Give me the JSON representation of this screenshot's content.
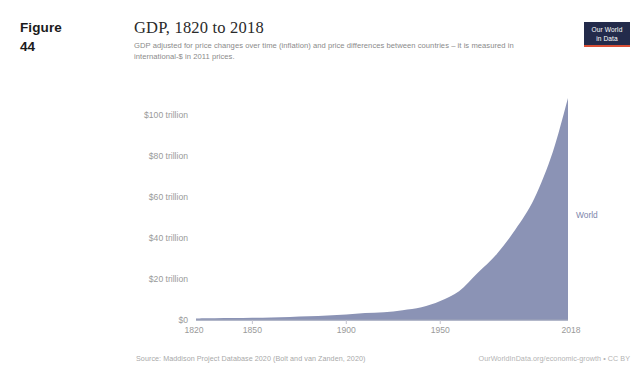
{
  "figure": {
    "word": "Figure",
    "number": "44"
  },
  "chart": {
    "title": "GDP, 1820 to 2018",
    "subtitle": "GDP adjusted for price changes over time (inflation) and price differences between countries – it is measured in international-$ in 2011 prices.",
    "logo": {
      "line1": "Our World",
      "line2": "in Data",
      "background": "#232b4b",
      "accent": "#d94f36"
    },
    "footer": {
      "source": "Source: Maddison Project Database 2020 (Bolt and van Zanden, 2020)",
      "credit": "OurWorldInData.org/economic-growth • CC BY"
    }
  },
  "chart_data": {
    "type": "area",
    "title": "GDP, 1820 to 2018",
    "subtitle": "GDP adjusted for price changes over time (inflation) and price differences between countries – it is measured in international-$ in 2011 prices.",
    "xlabel": "",
    "ylabel": "",
    "xlim": [
      1820,
      2018
    ],
    "ylim": [
      0,
      110
    ],
    "y_unit": "trillion international-$ (2011 prices)",
    "grid": false,
    "legend_position": "right-inline",
    "series_color": "#8b93b5",
    "series": [
      {
        "name": "World",
        "label": "World",
        "x": [
          1820,
          1830,
          1840,
          1850,
          1860,
          1870,
          1880,
          1890,
          1900,
          1910,
          1920,
          1930,
          1940,
          1950,
          1960,
          1970,
          1980,
          1990,
          2000,
          2010,
          2018
        ],
        "values": [
          0.74,
          0.82,
          0.92,
          1.05,
          1.25,
          1.5,
          1.85,
          2.2,
          2.7,
          3.4,
          3.8,
          4.8,
          6.2,
          9.3,
          14.0,
          23.0,
          32.0,
          44.0,
          59.0,
          82.0,
          108.0
        ]
      }
    ],
    "x_ticks": [
      {
        "value": 1820,
        "label": "1820"
      },
      {
        "value": 1850,
        "label": "1850"
      },
      {
        "value": 1900,
        "label": "1900"
      },
      {
        "value": 1950,
        "label": "1950"
      },
      {
        "value": 2018,
        "label": "2018"
      }
    ],
    "y_ticks": [
      {
        "value": 0,
        "label": "$0"
      },
      {
        "value": 20,
        "label": "$20 trillion"
      },
      {
        "value": 40,
        "label": "$40 trillion"
      },
      {
        "value": 60,
        "label": "$60 trillion"
      },
      {
        "value": 80,
        "label": "$80 trillion"
      },
      {
        "value": 100,
        "label": "$100 trillion"
      }
    ]
  }
}
